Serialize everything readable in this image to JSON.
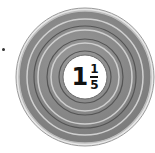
{
  "coin": {
    "label": {
      "whole": "1",
      "numerator": "1",
      "denominator": "5"
    },
    "colors": {
      "face": "#8a8a8a",
      "rim": "#d8d8d8",
      "groove_dark": "#5a5a5a",
      "groove_light": "#cfcfcf",
      "center": "#ffffff",
      "text": "#111111"
    }
  },
  "bullet": "•"
}
